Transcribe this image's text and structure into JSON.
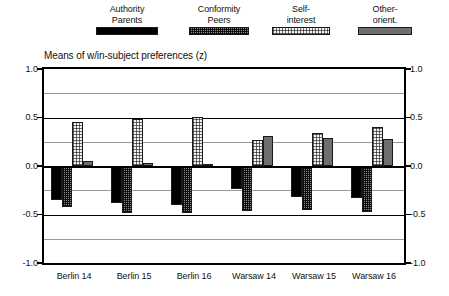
{
  "legend": {
    "items": [
      {
        "line1": "Authority",
        "line2": "Parents",
        "swatch": "parents-swatch",
        "color": "#000000"
      },
      {
        "line1": "Conformity",
        "line2": "Peers",
        "swatch": "peers-swatch",
        "color": "#8a8a8a"
      },
      {
        "line1": "Self-",
        "line2": "interest",
        "swatch": "self-swatch",
        "color": "#f2f2f2"
      },
      {
        "line1": "Other-",
        "line2": "orient.",
        "swatch": "other-swatch",
        "color": "#6e6e6e"
      }
    ]
  },
  "chart_data": {
    "type": "bar",
    "title": "Means of w/in-subject preferences (z)",
    "xlabel": "",
    "ylabel": "",
    "ylim": [
      -1.0,
      1.0
    ],
    "grid": true,
    "legend_position": "top",
    "y_ticks": [
      "1.0",
      "0.5",
      "0.0",
      "-0.5",
      "-1.0"
    ],
    "y_tick_values": [
      1.0,
      0.5,
      0.0,
      -0.5,
      -1.0
    ],
    "y_minor_values": [
      0.75,
      0.25,
      -0.25,
      -0.75
    ],
    "categories": [
      "Berlin 14",
      "Berlin 15",
      "Berlin 16",
      "Warsaw 14",
      "Warsaw 15",
      "Warsaw 16"
    ],
    "series": [
      {
        "name": "Authority Parents",
        "key": "parents",
        "values": [
          -0.35,
          -0.38,
          -0.4,
          -0.24,
          -0.32,
          -0.33
        ]
      },
      {
        "name": "Conformity Peers",
        "key": "peers",
        "values": [
          -0.42,
          -0.48,
          -0.48,
          -0.46,
          -0.45,
          -0.47
        ]
      },
      {
        "name": "Self-interest",
        "key": "self",
        "values": [
          0.45,
          0.48,
          0.51,
          0.27,
          0.34,
          0.4
        ]
      },
      {
        "name": "Other-orient.",
        "key": "other",
        "values": [
          0.05,
          0.03,
          0.02,
          0.31,
          0.29,
          0.28
        ]
      }
    ]
  }
}
